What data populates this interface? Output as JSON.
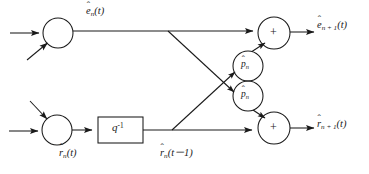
{
  "diagram": {
    "type": "signal-flow-graph",
    "canvas": {
      "width": 369,
      "height": 174
    },
    "style": {
      "line_color": "#1a1a1a",
      "text_color": "#1a1a1a",
      "background": "#ffffff",
      "stroke_width": 1.0
    },
    "nodes": [
      {
        "id": "sum-top-left",
        "kind": "summer",
        "label": "",
        "cx": 58,
        "cy": 33,
        "r": 15
      },
      {
        "id": "sum-bottom-left",
        "kind": "summer",
        "label": "",
        "cx": 57,
        "cy": 130,
        "r": 15
      },
      {
        "id": "delay",
        "kind": "block",
        "label": "q",
        "sup": "-1",
        "x": 98,
        "y": 117,
        "w": 45,
        "h": 26
      },
      {
        "id": "gain-upper",
        "kind": "gain",
        "label": "p",
        "cx": 248,
        "cy": 66,
        "r": 15
      },
      {
        "id": "gain-lower",
        "kind": "gain",
        "label": "p",
        "cx": 248,
        "cy": 96,
        "r": 15
      },
      {
        "id": "sum-top-right",
        "kind": "summer",
        "label": "+",
        "cx": 274,
        "cy": 33,
        "r": 16
      },
      {
        "id": "sum-bottom-right",
        "kind": "summer",
        "label": "+",
        "cx": 274,
        "cy": 128,
        "r": 16
      }
    ],
    "labels": {
      "forward_error_in": {
        "base": "e",
        "hat": "ˆ",
        "sub": "n",
        "arg": "(t)",
        "x": 86,
        "y": 6
      },
      "backward_error_in": {
        "base": "r",
        "hat": "ˆ",
        "sub": "n",
        "arg": "(t)",
        "x": 59,
        "y": 148
      },
      "delayed_backward": {
        "base": "r",
        "hat": "ˆ",
        "sub": "n",
        "arg": "(t－1)",
        "x": 160,
        "y": 148
      },
      "forward_error_out": {
        "base": "e",
        "hat": "ˆ",
        "sub": "n + 1",
        "arg": "(t)",
        "x": 317,
        "y": 20
      },
      "backward_error_out": {
        "base": "r",
        "hat": "ˆ",
        "sub": "n + 1",
        "arg": "(t)",
        "x": 317,
        "y": 119
      },
      "gain_upper": {
        "base": "p",
        "hat": "ˆ",
        "sub": "n",
        "arg": "",
        "x": 241,
        "y": 60
      },
      "gain_lower": {
        "base": "p",
        "hat": "ˆ",
        "sub": "n",
        "arg": "",
        "x": 241,
        "y": 90
      },
      "delay_block": {
        "base": "q",
        "sup": "-1",
        "x": 113,
        "y": 123
      },
      "sum_top_right_op": {
        "text": "+",
        "x": 270,
        "y": 26
      },
      "sum_bottom_right_op": {
        "text": "+",
        "x": 270,
        "y": 121
      }
    },
    "edges": [
      {
        "id": "edge-input-forward-h",
        "from": "external-left",
        "to": "sum-top-left",
        "arrow": true
      },
      {
        "id": "edge-input-forward-diag",
        "from": "external-below",
        "to": "sum-top-left",
        "arrow": true
      },
      {
        "id": "edge-input-backward-h",
        "from": "external-left",
        "to": "sum-bottom-left",
        "arrow": true
      },
      {
        "id": "edge-input-backward-diag",
        "from": "external-above",
        "to": "sum-bottom-left",
        "arrow": true
      },
      {
        "id": "edge-forward-bus",
        "from": "sum-top-left",
        "to": "sum-top-right",
        "arrow": true
      },
      {
        "id": "edge-delay-in",
        "from": "sum-bottom-left",
        "to": "delay",
        "arrow": true
      },
      {
        "id": "edge-backward-bus",
        "from": "delay",
        "to": "sum-bottom-right",
        "arrow": true
      },
      {
        "id": "edge-cross-down",
        "from": "forward-tap",
        "to": "gain-lower",
        "arrow": true
      },
      {
        "id": "edge-cross-up",
        "from": "backward-tap",
        "to": "gain-upper",
        "arrow": true
      },
      {
        "id": "edge-gain-upper-out",
        "from": "gain-upper",
        "to": "sum-top-right",
        "arrow": true
      },
      {
        "id": "edge-gain-lower-out",
        "from": "gain-lower",
        "to": "sum-bottom-right",
        "arrow": true
      },
      {
        "id": "edge-output-forward",
        "from": "sum-top-right",
        "to": "external-right",
        "arrow": true
      },
      {
        "id": "edge-output-backward",
        "from": "sum-bottom-right",
        "to": "external-right",
        "arrow": true
      }
    ]
  }
}
